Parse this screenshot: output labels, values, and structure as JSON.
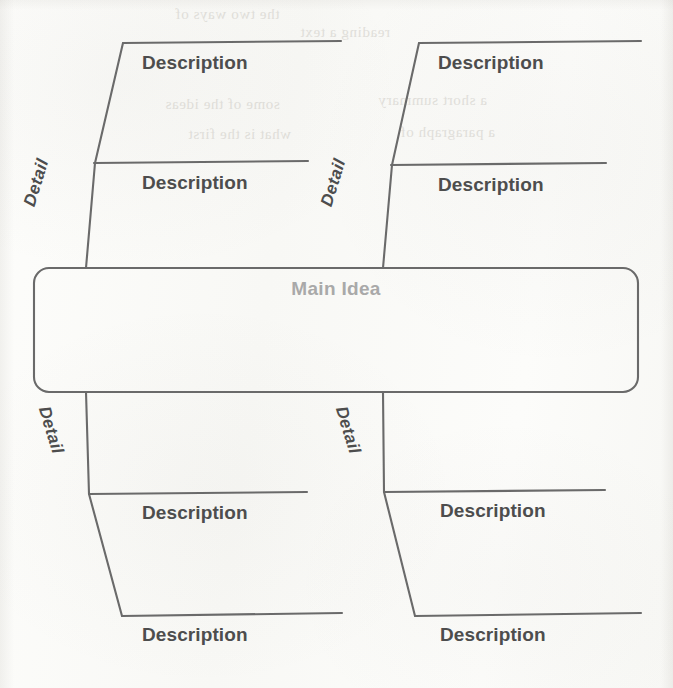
{
  "page": {
    "background_color": "#fbfbf9",
    "line_color": "#6a6a6a",
    "label_color": "#4d4d4d",
    "main_idea_color": "#a9a9a9"
  },
  "main_idea": {
    "label": "Main Idea"
  },
  "branches": [
    {
      "id": "top-left",
      "detail_label": "Detail",
      "descriptions": [
        {
          "label": "Description"
        },
        {
          "label": "Description"
        }
      ]
    },
    {
      "id": "top-right",
      "detail_label": "Detail",
      "descriptions": [
        {
          "label": "Description"
        },
        {
          "label": "Description"
        }
      ]
    },
    {
      "id": "bottom-left",
      "detail_label": "Detail",
      "descriptions": [
        {
          "label": "Description"
        },
        {
          "label": "Description"
        }
      ]
    },
    {
      "id": "bottom-right",
      "detail_label": "Detail",
      "descriptions": [
        {
          "label": "Description"
        },
        {
          "label": "Description"
        }
      ]
    }
  ],
  "ghost_text": {
    "lines": [
      "the two ways of",
      "reading a text",
      "some of the ideas",
      "a short summary",
      "what is the first",
      "a paragraph of"
    ]
  }
}
